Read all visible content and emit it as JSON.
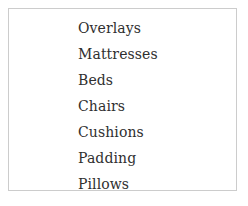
{
  "panel": {
    "background_color": "#ffffff",
    "border_color": "#cccccc",
    "text_color": "#2f2f2f"
  },
  "list": {
    "items": [
      {
        "label": "Overlays"
      },
      {
        "label": "Mattresses"
      },
      {
        "label": "Beds"
      },
      {
        "label": "Chairs"
      },
      {
        "label": "Cushions"
      },
      {
        "label": "Padding"
      },
      {
        "label": "Pillows"
      }
    ]
  }
}
